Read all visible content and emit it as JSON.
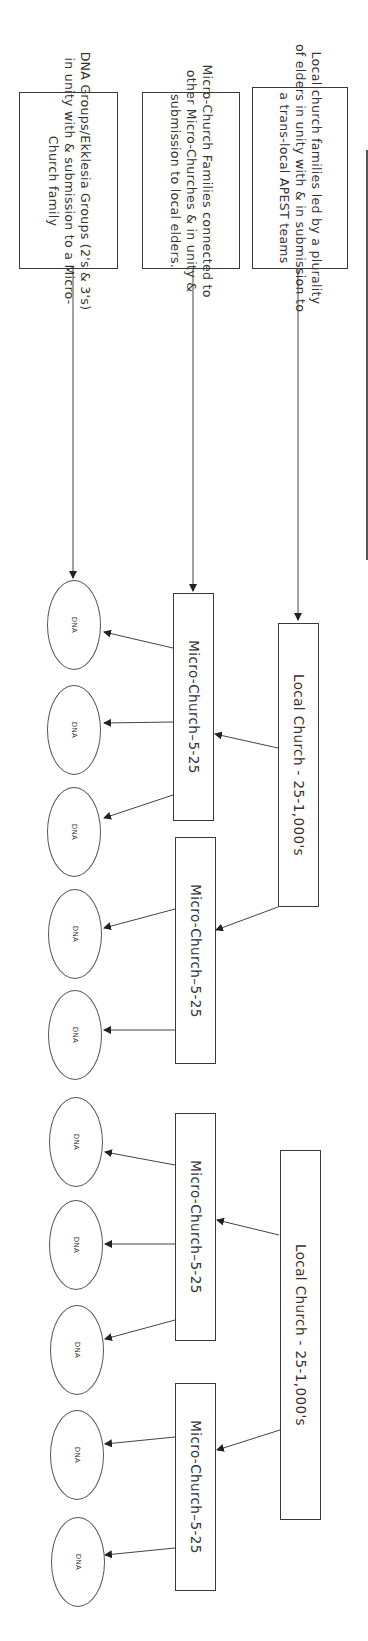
{
  "diagram": {
    "orientation": "rotated-90-clockwise",
    "legend": [
      {
        "id": "legend-local-church",
        "text_lines": [
          "Local church families led by a plurality",
          "of elders in unity with & in submission to",
          "a trans-local APEST teams"
        ]
      },
      {
        "id": "legend-micro-church",
        "text_lines": [
          "Micro-Church Families connected to",
          "other Micro-Churches & in unity &",
          "submission to local elders."
        ]
      },
      {
        "id": "legend-dna",
        "text_lines": [
          "DNA Groups/Ekklesia Groups (2's & 3's)",
          "in unity with & submission to a Micro-",
          "Church family"
        ]
      }
    ],
    "local_churches": [
      {
        "label": "Local Church - 25-1,000's"
      },
      {
        "label": "Local Church - 25-1,000's"
      }
    ],
    "micro_churches": [
      {
        "label": "Micro-Church–5-25",
        "parent": 0
      },
      {
        "label": "Micro-Church–5-25",
        "parent": 0
      },
      {
        "label": "Micro-Church–5-25",
        "parent": 1
      },
      {
        "label": "Micro-Church–5-25",
        "parent": 1
      }
    ],
    "dna_groups": [
      {
        "label": "DNA",
        "parent": 0
      },
      {
        "label": "DNA",
        "parent": 0
      },
      {
        "label": "DNA",
        "parent": 0
      },
      {
        "label": "DNA",
        "parent": 1
      },
      {
        "label": "DNA",
        "parent": 1
      },
      {
        "label": "DNA",
        "parent": 2
      },
      {
        "label": "DNA",
        "parent": 2
      },
      {
        "label": "DNA",
        "parent": 2
      },
      {
        "label": "DNA",
        "parent": 3
      },
      {
        "label": "DNA",
        "parent": 3
      }
    ],
    "colors": {
      "stroke": "#3a3a3a",
      "text": "#333333",
      "background": "#ffffff"
    }
  }
}
